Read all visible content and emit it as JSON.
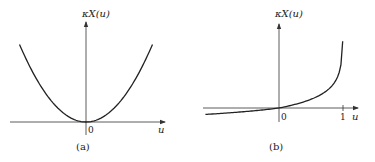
{
  "chart_data": [
    {
      "type": "line",
      "panel_label": "(a)",
      "ylabel": "κX(u)",
      "xlabel": "u",
      "x_tick_labels": [
        "0"
      ],
      "xlim": [
        -1.0,
        1.0
      ],
      "ylim": [
        -0.15,
        1.0
      ],
      "function": "convex parabola-like cumulant, minimum at u=0",
      "series": [
        {
          "name": "kappa_X(u)",
          "x": [
            -0.95,
            -0.75,
            -0.5,
            -0.25,
            0,
            0.25,
            0.5,
            0.75,
            0.95
          ],
          "y": [
            0.9,
            0.56,
            0.25,
            0.06,
            0,
            0.06,
            0.25,
            0.56,
            0.9
          ]
        }
      ]
    },
    {
      "type": "line",
      "panel_label": "(b)",
      "ylabel": "κX(u)",
      "xlabel": "u",
      "x_tick_labels": [
        "0",
        "1"
      ],
      "xlim": [
        -1.2,
        1.3
      ],
      "ylim": [
        -0.3,
        1.8
      ],
      "function": "increasing cumulant through origin, diverging as u→1",
      "series": [
        {
          "name": "kappa_X(u)",
          "x": [
            -1.1,
            -0.8,
            -0.5,
            -0.25,
            0,
            0.25,
            0.5,
            0.7,
            0.85,
            0.93,
            0.97,
            0.99
          ],
          "y": [
            -0.19,
            -0.15,
            -0.1,
            -0.05,
            0,
            0.07,
            0.17,
            0.3,
            0.5,
            0.75,
            1.05,
            1.35
          ]
        }
      ]
    }
  ]
}
